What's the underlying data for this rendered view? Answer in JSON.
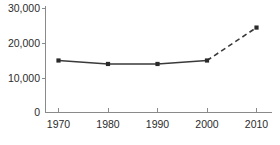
{
  "chart_data": {
    "type": "line",
    "title": "",
    "subtitle": "",
    "xlabel": "",
    "ylabel": "",
    "x": [
      1970,
      1980,
      1990,
      2000,
      2010
    ],
    "categories": [
      "1970",
      "1980",
      "1990",
      "2000",
      "2010"
    ],
    "values": [
      15000,
      14000,
      14000,
      15000,
      24500
    ],
    "series": [
      {
        "name": "",
        "values": [
          15000,
          14000,
          14000,
          15000,
          24500
        ],
        "segments": [
          {
            "style": "solid",
            "from_index": 0,
            "to_index": 3
          },
          {
            "style": "dashed",
            "from_index": 3,
            "to_index": 4
          }
        ],
        "marker": "square",
        "color": "#3a3a3a"
      }
    ],
    "xlim": [
      1965,
      2015
    ],
    "ylim": [
      0,
      31000
    ],
    "xticks": [
      1970,
      1980,
      1990,
      2000,
      2010
    ],
    "xtick_labels": [
      "1970",
      "1980",
      "1990",
      "2000",
      "2010"
    ],
    "yticks": [
      0,
      10000,
      20000,
      30000
    ],
    "ytick_labels": [
      "0",
      "10,000",
      "20,000",
      "30,000"
    ],
    "grid": false,
    "legend": null,
    "annotations": []
  },
  "axes": {
    "y_labels": [
      {
        "text": "30,000",
        "value": 30000
      },
      {
        "text": "20,000",
        "value": 20000
      },
      {
        "text": "10,000",
        "value": 10000
      },
      {
        "text": "0",
        "value": 0
      }
    ],
    "x_labels": [
      {
        "text": "1970",
        "value": 1970
      },
      {
        "text": "1980",
        "value": 1980
      },
      {
        "text": "1990",
        "value": 1990
      },
      {
        "text": "2000",
        "value": 2000
      },
      {
        "text": "2010",
        "value": 2010
      }
    ]
  },
  "colors": {
    "axis": "#8a8a8a",
    "line": "#3a3a3a",
    "marker": "#2a2a2a",
    "text": "#2b2b2b",
    "background": "#ffffff"
  }
}
